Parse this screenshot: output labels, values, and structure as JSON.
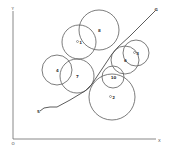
{
  "diagram": {
    "axes": {
      "origin_label": "O",
      "x_label": "X",
      "y_label": "Y",
      "origin": [
        13,
        139
      ],
      "x_end": [
        156,
        139
      ],
      "y_end": [
        13,
        11
      ]
    },
    "path": {
      "start_label": "S",
      "goal_label": "G",
      "points": [
        [
          40,
          111
        ],
        [
          44,
          108
        ],
        [
          50,
          107
        ],
        [
          57,
          107
        ],
        [
          70,
          100
        ],
        [
          85,
          91
        ],
        [
          92,
          84
        ],
        [
          100,
          72
        ],
        [
          106,
          63
        ],
        [
          112,
          54
        ],
        [
          118,
          47
        ],
        [
          130,
          36
        ],
        [
          142,
          24
        ],
        [
          155,
          11
        ]
      ]
    },
    "obstacles": [
      {
        "id": "8",
        "label": "8",
        "cx": 99,
        "cy": 30,
        "r": 20,
        "marker": false
      },
      {
        "id": "1",
        "label": "1",
        "cx": 79,
        "cy": 42,
        "r": 17,
        "marker": true
      },
      {
        "id": "4",
        "label": "4",
        "cx": 57,
        "cy": 70,
        "r": 15,
        "marker": false
      },
      {
        "id": "7",
        "label": "7",
        "cx": 77,
        "cy": 76,
        "r": 17,
        "marker": false
      },
      {
        "id": "3",
        "label": "3",
        "cx": 136,
        "cy": 53,
        "r": 13,
        "marker": true
      },
      {
        "id": "6",
        "label": "6",
        "cx": 125,
        "cy": 60,
        "r": 14,
        "marker": false
      },
      {
        "id": "10",
        "label": "10",
        "cx": 113,
        "cy": 77,
        "r": 11,
        "marker": false
      },
      {
        "id": "2",
        "label": "2",
        "cx": 112,
        "cy": 97,
        "r": 23,
        "marker": true
      }
    ]
  }
}
